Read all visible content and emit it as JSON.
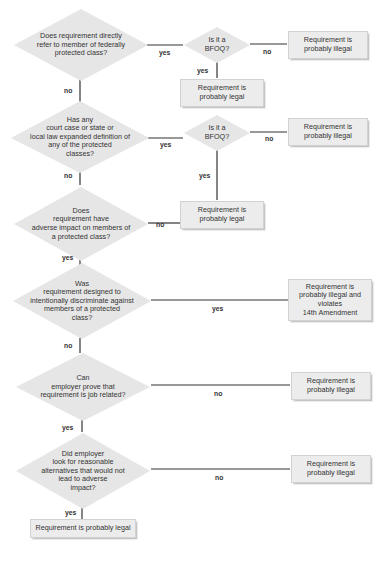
{
  "diagram": {
    "type": "flowchart",
    "colors": {
      "shape_fill": "#e6e6e6",
      "line": "#333333",
      "text": "#333333"
    },
    "decisions": [
      {
        "id": "q1",
        "text": "Does requirement directly\nrefer to member of federally\nprotected class?"
      },
      {
        "id": "bfoq1",
        "text": "Is it a\nBFOQ?"
      },
      {
        "id": "q2",
        "text": "Has any\ncourt case or state or\nlocal law expanded definition of\nany of the protected\nclasses?"
      },
      {
        "id": "bfoq2",
        "text": "Is it a\nBFOQ?"
      },
      {
        "id": "q3",
        "text": "Does\nrequirement have\nadverse impact on members of\na protected class?"
      },
      {
        "id": "q4",
        "text": "Was\nrequirement designed to\nintentionally discriminate against\nmembers of a protected\nclass?"
      },
      {
        "id": "q5",
        "text": "Can\nemployer prove that\nrequirement is job related?"
      },
      {
        "id": "q6",
        "text": "Did employer\nlook for reasonable\nalternatives that would not\nlead to adverse\nimpact?"
      }
    ],
    "outcomes": [
      {
        "id": "o1",
        "text": "Requirement is\nprobably illegal"
      },
      {
        "id": "o2",
        "text": "Requirement is\nprobably legal"
      },
      {
        "id": "o3",
        "text": "Requirement is\nprobably illegal"
      },
      {
        "id": "o4",
        "text": "Requirement is\nprobably legal"
      },
      {
        "id": "o5",
        "text": "Requirement is\nprobably illegal and\nviolates\n14th Amendment"
      },
      {
        "id": "o6",
        "text": "Requirement is\nprobably illegal"
      },
      {
        "id": "o7",
        "text": "Requirement is\nprobably illegal"
      },
      {
        "id": "o8",
        "text": "Requirement is probably legal"
      }
    ],
    "edge_labels": {
      "q1_yes": "yes",
      "q1_no": "no",
      "bfoq1_no": "no",
      "bfoq1_yes": "yes",
      "q2_yes": "yes",
      "q2_no": "no",
      "bfoq2_no": "no",
      "bfoq2_yes": "yes",
      "q3_no": "no",
      "q3_yes": "yes",
      "q4_yes": "yes",
      "q4_no": "no",
      "q5_no": "no",
      "q5_yes": "yes",
      "q6_no": "no",
      "q6_yes": "yes"
    }
  }
}
